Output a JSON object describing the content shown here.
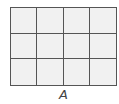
{
  "diagram": {
    "type": "grid",
    "rows": 3,
    "columns": 4,
    "label": "A",
    "colors": {
      "line": "#555555",
      "fill": "#f1f1f1",
      "label": "#444444"
    }
  }
}
